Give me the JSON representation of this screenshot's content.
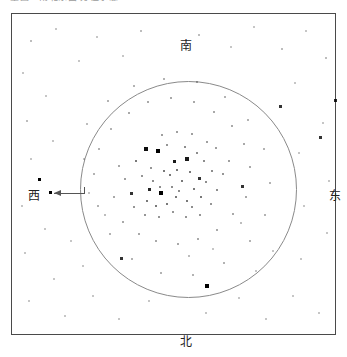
{
  "caption": {
    "text": "星图 ‧ 南北东西 方位示意",
    "note": "clipped at top edge of screenshot"
  },
  "chart": {
    "frame": {
      "x": 11,
      "y": 13,
      "width": 325,
      "height": 322,
      "border_color": "#4a4a4a"
    },
    "horizon_circle": {
      "cx": 176.5,
      "cy": 175.5,
      "r": 108,
      "color": "#8a8a8a"
    },
    "background": "#ffffff"
  },
  "cardinals": {
    "south": "南",
    "north": "北",
    "west": "西",
    "east": "东"
  },
  "annotation": {
    "pointer_label": "west-pointer-arrow",
    "from_x": 73,
    "to_x": 42,
    "y": 179,
    "target_star_x": 38,
    "target_star_y": 178.5,
    "color": "#555555"
  },
  "chart_data": {
    "type": "scatter",
    "xlabel": "",
    "ylabel": "",
    "xlim": [
      11,
      336
    ],
    "ylim": [
      13,
      335
    ],
    "grid": false,
    "legend": "none",
    "annotations": [
      "南",
      "北",
      "西",
      "东",
      "west-pointer-arrow"
    ],
    "series": [
      {
        "name": "stars",
        "encoding": "x, y in pixel coords; s = dot size px; o = opacity (magnitude proxy)",
        "points": [
          {
            "x": 157,
            "y": 150,
            "s": 4,
            "o": 1.0
          },
          {
            "x": 160,
            "y": 192,
            "s": 4,
            "o": 1.0
          },
          {
            "x": 145,
            "y": 148,
            "s": 3.5,
            "o": 0.95
          },
          {
            "x": 186,
            "y": 158,
            "s": 3.5,
            "o": 0.9
          },
          {
            "x": 173,
            "y": 160,
            "s": 3,
            "o": 0.9
          },
          {
            "x": 148,
            "y": 188,
            "s": 3,
            "o": 0.85
          },
          {
            "x": 130,
            "y": 192,
            "s": 3,
            "o": 0.8
          },
          {
            "x": 241,
            "y": 185,
            "s": 3,
            "o": 0.8
          },
          {
            "x": 198,
            "y": 177,
            "s": 3,
            "o": 0.8
          },
          {
            "x": 206,
            "y": 285,
            "s": 4,
            "o": 1.0
          },
          {
            "x": 279,
            "y": 105,
            "s": 3,
            "o": 0.8
          },
          {
            "x": 38,
            "y": 178,
            "s": 3,
            "o": 1.0
          },
          {
            "x": 319,
            "y": 136,
            "s": 3,
            "o": 0.8
          },
          {
            "x": 334,
            "y": 99,
            "s": 3,
            "o": 0.85
          },
          {
            "x": 120,
            "y": 257,
            "s": 3,
            "o": 0.8
          },
          {
            "x": 135,
            "y": 160,
            "s": 2.5,
            "o": 0.7
          },
          {
            "x": 163,
            "y": 170,
            "s": 2.5,
            "o": 0.7
          },
          {
            "x": 169,
            "y": 174,
            "s": 2.5,
            "o": 0.7
          },
          {
            "x": 176,
            "y": 169,
            "s": 2.5,
            "o": 0.7
          },
          {
            "x": 181,
            "y": 180,
            "s": 2.5,
            "o": 0.7
          },
          {
            "x": 189,
            "y": 171,
            "s": 2.5,
            "o": 0.7
          },
          {
            "x": 193,
            "y": 188,
            "s": 2.5,
            "o": 0.7
          },
          {
            "x": 200,
            "y": 196,
            "s": 2.5,
            "o": 0.7
          },
          {
            "x": 186,
            "y": 200,
            "s": 2.5,
            "o": 0.7
          },
          {
            "x": 175,
            "y": 196,
            "s": 2.5,
            "o": 0.7
          },
          {
            "x": 166,
            "y": 203,
            "s": 2.5,
            "o": 0.7
          },
          {
            "x": 155,
            "y": 205,
            "s": 2.5,
            "o": 0.7
          },
          {
            "x": 146,
            "y": 200,
            "s": 2.5,
            "o": 0.7
          },
          {
            "x": 152,
            "y": 180,
            "s": 2,
            "o": 0.6
          },
          {
            "x": 159,
            "y": 186,
            "s": 2,
            "o": 0.6
          },
          {
            "x": 171,
            "y": 186,
            "s": 2,
            "o": 0.6
          },
          {
            "x": 178,
            "y": 190,
            "s": 2,
            "o": 0.6
          },
          {
            "x": 191,
            "y": 206,
            "s": 2,
            "o": 0.6
          },
          {
            "x": 205,
            "y": 181,
            "s": 2,
            "o": 0.6
          },
          {
            "x": 211,
            "y": 170,
            "s": 2,
            "o": 0.6
          },
          {
            "x": 216,
            "y": 189,
            "s": 2,
            "o": 0.6
          },
          {
            "x": 203,
            "y": 160,
            "s": 2,
            "o": 0.6
          },
          {
            "x": 196,
            "y": 152,
            "s": 2,
            "o": 0.6
          },
          {
            "x": 184,
            "y": 146,
            "s": 2,
            "o": 0.6
          },
          {
            "x": 166,
            "y": 144,
            "s": 2,
            "o": 0.55
          },
          {
            "x": 150,
            "y": 167,
            "s": 2,
            "o": 0.55
          },
          {
            "x": 141,
            "y": 175,
            "s": 2,
            "o": 0.55
          },
          {
            "x": 133,
            "y": 206,
            "s": 2,
            "o": 0.55
          },
          {
            "x": 144,
            "y": 214,
            "s": 2,
            "o": 0.55
          },
          {
            "x": 158,
            "y": 216,
            "s": 2,
            "o": 0.55
          },
          {
            "x": 172,
            "y": 211,
            "s": 2,
            "o": 0.55
          },
          {
            "x": 185,
            "y": 216,
            "s": 2,
            "o": 0.55
          },
          {
            "x": 199,
            "y": 214,
            "s": 2,
            "o": 0.55
          },
          {
            "x": 210,
            "y": 203,
            "s": 2,
            "o": 0.55
          },
          {
            "x": 222,
            "y": 173,
            "s": 2,
            "o": 0.55
          },
          {
            "x": 228,
            "y": 160,
            "s": 2,
            "o": 0.5
          },
          {
            "x": 215,
            "y": 147,
            "s": 2,
            "o": 0.5
          },
          {
            "x": 206,
            "y": 141,
            "s": 2,
            "o": 0.5
          },
          {
            "x": 191,
            "y": 133,
            "s": 2,
            "o": 0.5
          },
          {
            "x": 176,
            "y": 131,
            "s": 2,
            "o": 0.5
          },
          {
            "x": 161,
            "y": 134,
            "s": 2,
            "o": 0.5
          },
          {
            "x": 124,
            "y": 178,
            "s": 2,
            "o": 0.5
          },
          {
            "x": 118,
            "y": 165,
            "s": 2,
            "o": 0.45
          },
          {
            "x": 113,
            "y": 196,
            "s": 2,
            "o": 0.45
          },
          {
            "x": 122,
            "y": 221,
            "s": 2,
            "o": 0.45
          },
          {
            "x": 138,
            "y": 233,
            "s": 2,
            "o": 0.45
          },
          {
            "x": 155,
            "y": 240,
            "s": 2,
            "o": 0.45
          },
          {
            "x": 177,
            "y": 243,
            "s": 2,
            "o": 0.45
          },
          {
            "x": 197,
            "y": 238,
            "s": 2,
            "o": 0.45
          },
          {
            "x": 216,
            "y": 229,
            "s": 2,
            "o": 0.45
          },
          {
            "x": 232,
            "y": 213,
            "s": 2,
            "o": 0.45
          },
          {
            "x": 245,
            "y": 196,
            "s": 2,
            "o": 0.45
          },
          {
            "x": 249,
            "y": 166,
            "s": 2,
            "o": 0.45
          },
          {
            "x": 243,
            "y": 143,
            "s": 2,
            "o": 0.45
          },
          {
            "x": 231,
            "y": 125,
            "s": 2,
            "o": 0.45
          },
          {
            "x": 213,
            "y": 111,
            "s": 2,
            "o": 0.45
          },
          {
            "x": 193,
            "y": 101,
            "s": 2,
            "o": 0.45
          },
          {
            "x": 170,
            "y": 97,
            "s": 2,
            "o": 0.45
          },
          {
            "x": 147,
            "y": 101,
            "s": 2,
            "o": 0.45
          },
          {
            "x": 128,
            "y": 112,
            "s": 2,
            "o": 0.45
          },
          {
            "x": 110,
            "y": 128,
            "s": 2,
            "o": 0.4
          },
          {
            "x": 98,
            "y": 148,
            "s": 2,
            "o": 0.4
          },
          {
            "x": 93,
            "y": 173,
            "s": 2,
            "o": 0.4
          },
          {
            "x": 97,
            "y": 205,
            "s": 2,
            "o": 0.4
          },
          {
            "x": 109,
            "y": 233,
            "s": 2,
            "o": 0.4
          },
          {
            "x": 131,
            "y": 258,
            "s": 2,
            "o": 0.4
          },
          {
            "x": 160,
            "y": 272,
            "s": 2,
            "o": 0.4
          },
          {
            "x": 192,
            "y": 274,
            "s": 2,
            "o": 0.4
          },
          {
            "x": 223,
            "y": 262,
            "s": 2,
            "o": 0.4
          },
          {
            "x": 249,
            "y": 240,
            "s": 2,
            "o": 0.4
          },
          {
            "x": 264,
            "y": 214,
            "s": 2,
            "o": 0.4
          },
          {
            "x": 269,
            "y": 182,
            "s": 2,
            "o": 0.4
          },
          {
            "x": 263,
            "y": 148,
            "s": 2,
            "o": 0.4
          },
          {
            "x": 247,
            "y": 119,
            "s": 2,
            "o": 0.4
          },
          {
            "x": 224,
            "y": 96,
            "s": 2,
            "o": 0.4
          },
          {
            "x": 196,
            "y": 81,
            "s": 2,
            "o": 0.4
          },
          {
            "x": 163,
            "y": 78,
            "s": 2,
            "o": 0.4
          },
          {
            "x": 133,
            "y": 85,
            "s": 2,
            "o": 0.4
          },
          {
            "x": 107,
            "y": 100,
            "s": 2,
            "o": 0.4
          },
          {
            "x": 86,
            "y": 123,
            "s": 2,
            "o": 0.35
          },
          {
            "x": 30,
            "y": 40,
            "s": 2,
            "o": 0.35
          },
          {
            "x": 55,
            "y": 28,
            "s": 2,
            "o": 0.3
          },
          {
            "x": 78,
            "y": 60,
            "s": 2,
            "o": 0.3
          },
          {
            "x": 96,
            "y": 36,
            "s": 2,
            "o": 0.3
          },
          {
            "x": 122,
            "y": 55,
            "s": 2,
            "o": 0.3
          },
          {
            "x": 140,
            "y": 30,
            "s": 2,
            "o": 0.35
          },
          {
            "x": 198,
            "y": 34,
            "s": 2,
            "o": 0.35
          },
          {
            "x": 230,
            "y": 46,
            "s": 2,
            "o": 0.3
          },
          {
            "x": 253,
            "y": 26,
            "s": 2,
            "o": 0.3
          },
          {
            "x": 281,
            "y": 48,
            "s": 2,
            "o": 0.35
          },
          {
            "x": 305,
            "y": 30,
            "s": 2,
            "o": 0.3
          },
          {
            "x": 325,
            "y": 57,
            "s": 2,
            "o": 0.35
          },
          {
            "x": 22,
            "y": 72,
            "s": 2,
            "o": 0.3
          },
          {
            "x": 45,
            "y": 95,
            "s": 2,
            "o": 0.3
          },
          {
            "x": 26,
            "y": 120,
            "s": 2,
            "o": 0.35
          },
          {
            "x": 52,
            "y": 140,
            "s": 2,
            "o": 0.3
          },
          {
            "x": 30,
            "y": 158,
            "s": 2,
            "o": 0.3
          },
          {
            "x": 21,
            "y": 205,
            "s": 2,
            "o": 0.3
          },
          {
            "x": 44,
            "y": 228,
            "s": 2,
            "o": 0.3
          },
          {
            "x": 24,
            "y": 252,
            "s": 2,
            "o": 0.3
          },
          {
            "x": 53,
            "y": 278,
            "s": 2,
            "o": 0.3
          },
          {
            "x": 28,
            "y": 300,
            "s": 2,
            "o": 0.3
          },
          {
            "x": 64,
            "y": 315,
            "s": 2,
            "o": 0.3
          },
          {
            "x": 92,
            "y": 295,
            "s": 2,
            "o": 0.3
          },
          {
            "x": 118,
            "y": 318,
            "s": 2,
            "o": 0.3
          },
          {
            "x": 148,
            "y": 300,
            "s": 2,
            "o": 0.3
          },
          {
            "x": 205,
            "y": 312,
            "s": 2,
            "o": 0.3
          },
          {
            "x": 238,
            "y": 297,
            "s": 2,
            "o": 0.3
          },
          {
            "x": 265,
            "y": 318,
            "s": 2,
            "o": 0.3
          },
          {
            "x": 292,
            "y": 295,
            "s": 2,
            "o": 0.3
          },
          {
            "x": 318,
            "y": 312,
            "s": 2,
            "o": 0.3
          },
          {
            "x": 300,
            "y": 258,
            "s": 2,
            "o": 0.3
          },
          {
            "x": 326,
            "y": 232,
            "s": 2,
            "o": 0.3
          },
          {
            "x": 303,
            "y": 205,
            "s": 2,
            "o": 0.3
          },
          {
            "x": 328,
            "y": 180,
            "s": 2,
            "o": 0.3
          },
          {
            "x": 298,
            "y": 152,
            "s": 2,
            "o": 0.3
          },
          {
            "x": 322,
            "y": 122,
            "s": 2,
            "o": 0.3
          },
          {
            "x": 294,
            "y": 82,
            "s": 2,
            "o": 0.3
          },
          {
            "x": 70,
            "y": 240,
            "s": 2,
            "o": 0.3
          },
          {
            "x": 82,
            "y": 265,
            "s": 2,
            "o": 0.3
          },
          {
            "x": 255,
            "y": 270,
            "s": 2,
            "o": 0.3
          },
          {
            "x": 272,
            "y": 250,
            "s": 2,
            "o": 0.3
          },
          {
            "x": 240,
            "y": 222,
            "s": 2,
            "o": 0.35
          },
          {
            "x": 188,
            "y": 255,
            "s": 2,
            "o": 0.35
          },
          {
            "x": 212,
            "y": 248,
            "s": 2,
            "o": 0.3
          },
          {
            "x": 104,
            "y": 214,
            "s": 2,
            "o": 0.35
          },
          {
            "x": 88,
            "y": 192,
            "s": 2,
            "o": 0.3
          },
          {
            "x": 83,
            "y": 158,
            "s": 2,
            "o": 0.3
          }
        ]
      }
    ]
  }
}
